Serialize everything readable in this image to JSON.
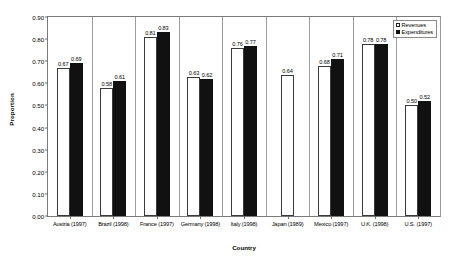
{
  "chart_data": {
    "type": "bar",
    "title": "",
    "xlabel": "Country",
    "ylabel": "Proportion",
    "ylim": [
      0.0,
      0.9
    ],
    "ytick_step": 0.1,
    "ytick_labels": [
      "0.00",
      "0.10",
      "0.20",
      "0.30",
      "0.40",
      "0.50",
      "0.60",
      "0.70",
      "0.80",
      "0.90"
    ],
    "grid": false,
    "legend_position": "top-right",
    "categories": [
      "Austria (1997)",
      "Brazil (1998)",
      "France (1997)",
      "Germany (1998)",
      "Italy (1998)",
      "Japan (1989)",
      "Mexico (1997)",
      "U.K. (1998)",
      "U.S. (1997)"
    ],
    "series": [
      {
        "name": "Revenues",
        "color": "#ffffff",
        "values": [
          0.67,
          0.58,
          0.81,
          0.63,
          0.76,
          0.64,
          0.68,
          0.78,
          0.5
        ],
        "labels": [
          "0.67",
          "0.58",
          "0.81",
          "0.63",
          "0.76",
          "0.64",
          "0.68",
          "0.78",
          "0.50"
        ]
      },
      {
        "name": "Expenditures",
        "color": "#111111",
        "values": [
          0.69,
          0.61,
          0.83,
          0.62,
          0.77,
          null,
          0.71,
          0.78,
          0.52
        ],
        "labels": [
          "0.69",
          "0.61",
          "0.83",
          "0.62",
          "0.77",
          null,
          "0.71",
          "0.78",
          "0.52"
        ]
      }
    ]
  },
  "legend": {
    "items": [
      {
        "label": "Revenues",
        "swatch": "revenues"
      },
      {
        "label": "Expenditures",
        "swatch": "expenditures"
      }
    ]
  }
}
